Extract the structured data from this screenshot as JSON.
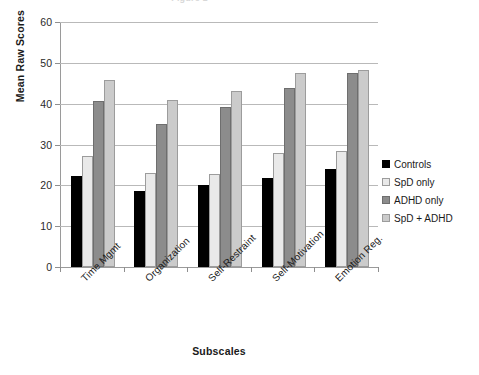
{
  "chart_data": {
    "type": "bar",
    "title": "Figure 1",
    "xlabel": "Subscales",
    "ylabel": "Mean Raw Scores",
    "ylim": [
      0,
      60
    ],
    "yticks": [
      0,
      10,
      20,
      30,
      40,
      50,
      60
    ],
    "grid": true,
    "legend_position": "right",
    "categories": [
      "Time Mgmt",
      "Organization",
      "Self-Restraint",
      "Self-Motivation",
      "Emotion Reg."
    ],
    "series": [
      {
        "name": "Controls",
        "color": "#000000",
        "values": [
          22.3,
          18.6,
          20.0,
          21.7,
          24.0
        ]
      },
      {
        "name": "SpD only",
        "color": "#e9e9e9",
        "values": [
          27.2,
          23.1,
          22.7,
          28.0,
          28.4
        ]
      },
      {
        "name": "ADHD only",
        "color": "#8c8c8c",
        "values": [
          40.6,
          35.0,
          39.3,
          43.8,
          47.5
        ]
      },
      {
        "name": "SpD + ADHD",
        "color": "#cbcbcb",
        "values": [
          45.7,
          40.8,
          43.0,
          47.5,
          48.2
        ]
      }
    ]
  }
}
